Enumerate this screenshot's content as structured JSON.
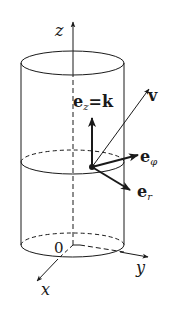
{
  "figure": {
    "colors": {
      "stroke": "#1a1a1a",
      "background": "#ffffff"
    },
    "axes": {
      "z_label": "z",
      "x_label": "x",
      "y_label": "y",
      "origin_label": "0"
    },
    "vectors": {
      "ez_label_main": "e",
      "ez_label_sub": "z",
      "ez_label_eq": "=k",
      "v_label": "v",
      "ephi_label_main": "e",
      "ephi_label_sub": "φ",
      "er_label_main": "e",
      "er_label_sub": "r"
    }
  }
}
